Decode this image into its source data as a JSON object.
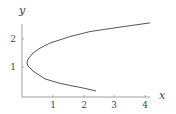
{
  "chart_data": {
    "type": "line",
    "title": "",
    "xlabel": "x",
    "ylabel": "y",
    "xlim": [
      0,
      4.3
    ],
    "ylim": [
      0,
      2.6
    ],
    "grid": false,
    "legend": null,
    "x_ticks": [
      "1",
      "2",
      "3",
      "4"
    ],
    "y_ticks": [
      "1",
      "2"
    ],
    "series": [
      {
        "name": "curve",
        "color": "#555555",
        "x": [
          2.41,
          2.05,
          1.56,
          1.24,
          0.75,
          0.36,
          0.2,
          0.16,
          0.2,
          0.36,
          0.59,
          0.91,
          1.56,
          2.21,
          3.19,
          4.17
        ],
        "y": [
          0.18,
          0.27,
          0.38,
          0.45,
          0.61,
          0.89,
          1.07,
          1.18,
          1.32,
          1.54,
          1.71,
          1.89,
          2.12,
          2.3,
          2.46,
          2.61
        ]
      }
    ]
  },
  "axes": {
    "x_label": "x",
    "y_label": "y",
    "x_tick_labels": [
      "1",
      "2",
      "3",
      "4"
    ],
    "y_tick_labels": [
      "1",
      "2"
    ]
  }
}
